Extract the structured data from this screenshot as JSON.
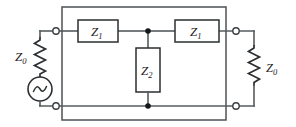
{
  "diagram": {
    "background_color": "#ffffff",
    "wire_color": "#555b5e",
    "component_color": "#2b2f31",
    "label_color": "#1d2123"
  },
  "source": {
    "impedance_label": "Z",
    "impedance_subscript": "0",
    "symbol": "ac-voltage-source",
    "wave_glyph": "sine-wave"
  },
  "load": {
    "impedance_label": "Z",
    "impedance_subscript": "0",
    "symbol": "resistor-zigzag"
  },
  "network": {
    "name": "t-network",
    "series_elements": [
      {
        "label": "Z",
        "subscript": "1",
        "position": "series-left"
      },
      {
        "label": "Z",
        "subscript": "1",
        "position": "series-right"
      }
    ],
    "shunt_elements": [
      {
        "label": "Z",
        "subscript": "2",
        "position": "shunt-middle"
      }
    ]
  },
  "terminals": [
    {
      "name": "input-top",
      "type": "open-circle"
    },
    {
      "name": "input-bottom",
      "type": "open-circle"
    },
    {
      "name": "output-top",
      "type": "open-circle"
    },
    {
      "name": "output-bottom",
      "type": "open-circle"
    }
  ],
  "junctions": [
    {
      "name": "top-shunt-node",
      "type": "solid-dot"
    },
    {
      "name": "bottom-shunt-node",
      "type": "solid-dot"
    }
  ]
}
